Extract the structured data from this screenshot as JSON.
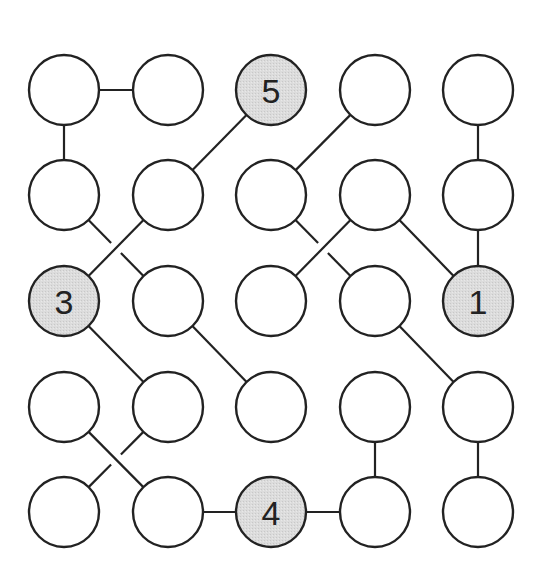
{
  "puzzle": {
    "grid": {
      "rows": 5,
      "cols": 5
    },
    "layout": {
      "col_x": [
        64,
        168,
        271,
        375,
        478
      ],
      "row_y": [
        90,
        195,
        301,
        407,
        512
      ],
      "radius": 35
    },
    "colors": {
      "clue_fill": "#d9d9d9",
      "empty_fill": "#ffffff",
      "stroke": "#222222"
    },
    "nodes": [
      {
        "r": 0,
        "c": 0,
        "label": ""
      },
      {
        "r": 0,
        "c": 1,
        "label": ""
      },
      {
        "r": 0,
        "c": 2,
        "label": "5"
      },
      {
        "r": 0,
        "c": 3,
        "label": ""
      },
      {
        "r": 0,
        "c": 4,
        "label": ""
      },
      {
        "r": 1,
        "c": 0,
        "label": ""
      },
      {
        "r": 1,
        "c": 1,
        "label": ""
      },
      {
        "r": 1,
        "c": 2,
        "label": ""
      },
      {
        "r": 1,
        "c": 3,
        "label": ""
      },
      {
        "r": 1,
        "c": 4,
        "label": ""
      },
      {
        "r": 2,
        "c": 0,
        "label": "3"
      },
      {
        "r": 2,
        "c": 1,
        "label": ""
      },
      {
        "r": 2,
        "c": 2,
        "label": ""
      },
      {
        "r": 2,
        "c": 3,
        "label": ""
      },
      {
        "r": 2,
        "c": 4,
        "label": "1"
      },
      {
        "r": 3,
        "c": 0,
        "label": ""
      },
      {
        "r": 3,
        "c": 1,
        "label": ""
      },
      {
        "r": 3,
        "c": 2,
        "label": ""
      },
      {
        "r": 3,
        "c": 3,
        "label": ""
      },
      {
        "r": 3,
        "c": 4,
        "label": ""
      },
      {
        "r": 4,
        "c": 0,
        "label": ""
      },
      {
        "r": 4,
        "c": 1,
        "label": ""
      },
      {
        "r": 4,
        "c": 2,
        "label": "4"
      },
      {
        "r": 4,
        "c": 3,
        "label": ""
      },
      {
        "r": 4,
        "c": 4,
        "label": ""
      }
    ],
    "edges": [
      {
        "a": [
          0,
          0
        ],
        "b": [
          0,
          1
        ],
        "gap": false
      },
      {
        "a": [
          0,
          0
        ],
        "b": [
          1,
          0
        ],
        "gap": false
      },
      {
        "a": [
          0,
          2
        ],
        "b": [
          1,
          1
        ],
        "gap": false
      },
      {
        "a": [
          0,
          3
        ],
        "b": [
          1,
          2
        ],
        "gap": false
      },
      {
        "a": [
          0,
          4
        ],
        "b": [
          1,
          4
        ],
        "gap": false
      },
      {
        "a": [
          1,
          4
        ],
        "b": [
          2,
          4
        ],
        "gap": false
      },
      {
        "a": [
          1,
          0
        ],
        "b": [
          2,
          1
        ],
        "gap": true
      },
      {
        "a": [
          1,
          1
        ],
        "b": [
          2,
          0
        ],
        "gap": false
      },
      {
        "a": [
          1,
          2
        ],
        "b": [
          2,
          3
        ],
        "gap": true
      },
      {
        "a": [
          1,
          3
        ],
        "b": [
          2,
          2
        ],
        "gap": false
      },
      {
        "a": [
          1,
          3
        ],
        "b": [
          2,
          4
        ],
        "gap": false
      },
      {
        "a": [
          2,
          0
        ],
        "b": [
          3,
          1
        ],
        "gap": false
      },
      {
        "a": [
          2,
          1
        ],
        "b": [
          3,
          2
        ],
        "gap": false
      },
      {
        "a": [
          2,
          3
        ],
        "b": [
          3,
          4
        ],
        "gap": false
      },
      {
        "a": [
          3,
          0
        ],
        "b": [
          4,
          1
        ],
        "gap": false
      },
      {
        "a": [
          3,
          1
        ],
        "b": [
          4,
          0
        ],
        "gap": true
      },
      {
        "a": [
          4,
          1
        ],
        "b": [
          4,
          2
        ],
        "gap": false
      },
      {
        "a": [
          4,
          2
        ],
        "b": [
          4,
          3
        ],
        "gap": false
      },
      {
        "a": [
          3,
          3
        ],
        "b": [
          4,
          3
        ],
        "gap": false
      },
      {
        "a": [
          3,
          4
        ],
        "b": [
          4,
          4
        ],
        "gap": false
      }
    ]
  }
}
